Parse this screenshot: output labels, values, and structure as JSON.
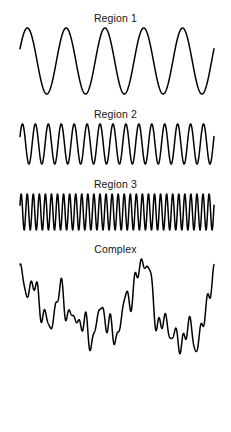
{
  "figure": {
    "background_color": "#ffffff",
    "stroke_color": "#000000",
    "width": 231,
    "height": 432
  },
  "panels": [
    {
      "title": "Region 1",
      "wave_type": "sine",
      "cycles": 5,
      "amplitude": 1.0,
      "line_width": 1.5,
      "plot_left": 20,
      "plot_right": 214,
      "plot_height": 72,
      "phase": 0.38
    },
    {
      "title": "Region 2",
      "wave_type": "sine",
      "cycles": 15,
      "amplitude": 1.0,
      "line_width": 1.5,
      "plot_left": 20,
      "plot_right": 214,
      "plot_height": 46,
      "phase": 0.38
    },
    {
      "title": "Region 3",
      "wave_type": "sine",
      "cycles": 32,
      "amplitude": 1.0,
      "line_width": 1.5,
      "plot_left": 20,
      "plot_right": 214,
      "plot_height": 42,
      "phase": 0.38
    },
    {
      "title": "Complex",
      "wave_type": "composite",
      "line_width": 1.5,
      "plot_left": 20,
      "plot_right": 214,
      "plot_height": 112,
      "components": [
        {
          "cycles": 2.0,
          "amplitude": 0.46,
          "phase": 0.3
        },
        {
          "cycles": 3.0,
          "amplitude": 0.3,
          "phase": 1.9
        },
        {
          "cycles": 5.0,
          "amplitude": 0.26,
          "phase": 0.8
        },
        {
          "cycles": 9.0,
          "amplitude": 0.2,
          "phase": 2.6
        },
        {
          "cycles": 15.0,
          "amplitude": 0.16,
          "phase": 1.1
        },
        {
          "cycles": 24.0,
          "amplitude": 0.13,
          "phase": 0.5
        },
        {
          "cycles": 32.0,
          "amplitude": 0.09,
          "phase": 2.2
        }
      ]
    }
  ],
  "chart_data": {
    "type": "line",
    "title": "",
    "xlabel": "",
    "ylabel": "",
    "grid": false,
    "legend": "none",
    "series": [
      {
        "name": "Region 1",
        "waveform": "sinusoid",
        "frequency_cycles_across_panel": 5,
        "relative_amplitude": 1.0
      },
      {
        "name": "Region 2",
        "waveform": "sinusoid",
        "frequency_cycles_across_panel": 15,
        "relative_amplitude": 1.0
      },
      {
        "name": "Region 3",
        "waveform": "sinusoid",
        "frequency_cycles_across_panel": 32,
        "relative_amplitude": 1.0
      },
      {
        "name": "Complex",
        "waveform": "sum-of-sinusoids",
        "frequency_cycles_across_panel": [
          2,
          3,
          5,
          9,
          15,
          24,
          32
        ],
        "relative_amplitude": [
          0.46,
          0.3,
          0.26,
          0.2,
          0.16,
          0.13,
          0.09
        ]
      }
    ]
  }
}
